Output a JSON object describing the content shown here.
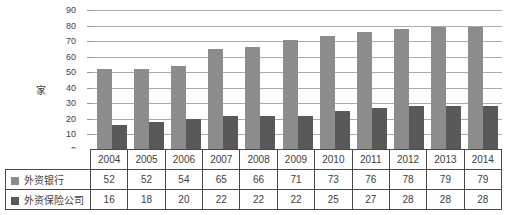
{
  "chart_data": {
    "type": "bar",
    "title": "",
    "xlabel": "",
    "ylabel": "家",
    "categories": [
      "2004",
      "2005",
      "2006",
      "2007",
      "2008",
      "2009",
      "2010",
      "2011",
      "2012",
      "2013",
      "2014"
    ],
    "series": [
      {
        "name": "外资银行",
        "key": "bank",
        "color": "#8C8C8C",
        "values": [
          52,
          52,
          54,
          65,
          66,
          71,
          73,
          76,
          78,
          79,
          79
        ]
      },
      {
        "name": "外资保险公司",
        "key": "insurance",
        "color": "#595959",
        "values": [
          16,
          18,
          20,
          22,
          22,
          22,
          25,
          27,
          28,
          28,
          28
        ]
      }
    ],
    "ylim": [
      0,
      90
    ],
    "yticks": [
      0,
      10,
      20,
      30,
      40,
      50,
      60,
      70,
      80,
      90
    ],
    "grid": true,
    "legend_position": "data-table-left"
  },
  "colors": {
    "background": "#ffffff",
    "gridline": "#ababab",
    "table_border": "#4a4a4a",
    "text": "#404040"
  }
}
